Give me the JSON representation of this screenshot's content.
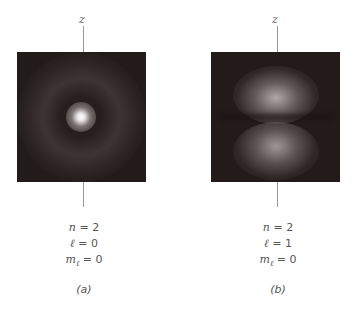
{
  "axis_label": "z",
  "panels": [
    {
      "id": "a",
      "caption": "(a)",
      "n": "n = 2",
      "l": "ℓ = 0",
      "m": "mℓ = 0",
      "n_val": "2",
      "l_val": "0",
      "m_val": "0",
      "orbital": "2s"
    },
    {
      "id": "b",
      "caption": "(b)",
      "n": "n = 2",
      "l": "ℓ = 1",
      "m": "mℓ = 0",
      "n_val": "2",
      "l_val": "1",
      "m_val": "0",
      "orbital": "2p (m=0)"
    }
  ],
  "colors": {
    "background": "#231a1a",
    "axis": "#999999",
    "text": "#555555"
  }
}
